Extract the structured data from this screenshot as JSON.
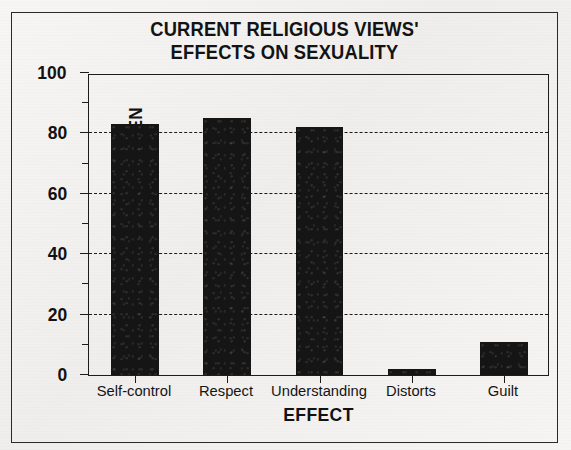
{
  "figure": {
    "title_line1": "CURRENT RELIGIOUS VIEWS'",
    "title_line2": "EFFECTS ON SEXUALITY",
    "title": "CURRENT RELIGIOUS VIEWS'\nEFFECTS ON SEXUALITY"
  },
  "chart_data": {
    "type": "bar",
    "title": "CURRENT RELIGIOUS VIEWS' EFFECTS ON SEXUALITY",
    "xlabel": "EFFECT",
    "ylabel": "PERCENT OF RELIGIOUS MEN",
    "categories": [
      "Self-control",
      "Respect",
      "Understanding",
      "Distorts",
      "Guilt"
    ],
    "values": [
      83,
      85,
      82,
      2,
      11
    ],
    "ylim": [
      0,
      100
    ],
    "yticks": [
      0,
      20,
      40,
      60,
      80,
      100
    ],
    "ytick_labels": [
      "0",
      "20",
      "40",
      "60",
      "80",
      "100"
    ],
    "yticks_minor": [
      10,
      30,
      50,
      70,
      90
    ],
    "gridlines": [
      20,
      40,
      60,
      80
    ],
    "grid": true,
    "grid_style": "dashed",
    "legend": null,
    "bar_color": "#151515",
    "series": [
      {
        "name": "Percent of religious men",
        "values": [
          83,
          85,
          82,
          2,
          11
        ]
      }
    ]
  }
}
